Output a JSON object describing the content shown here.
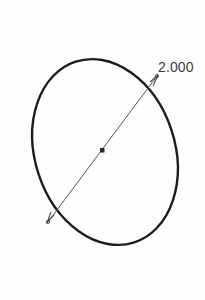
{
  "app": {
    "view_name": "sketch-canvas",
    "background_color": "#fefefe"
  },
  "drawing": {
    "title": "Ellipse with major axis dimension",
    "units_implied": "inches",
    "entities": [
      {
        "name": "ellipse-outline",
        "type": "ellipse",
        "center": {
          "x": 105,
          "y": 152
        },
        "radius_x": 70,
        "radius_y": 95,
        "rotation_deg": -18,
        "stroke_color": "#1d1d1d",
        "stroke_width": 2.4
      },
      {
        "name": "major-axis-dimension-line",
        "type": "line",
        "from": {
          "x": 48,
          "y": 222
        },
        "to": {
          "x": 157,
          "y": 76
        },
        "stroke_color": "#555555",
        "stroke_width": 1
      },
      {
        "name": "center-point-marker",
        "type": "square-point",
        "at": {
          "x": 102,
          "y": 150
        },
        "size": 4,
        "fill_color": "#2a2a2a"
      },
      {
        "name": "endpoint-marker-upper",
        "type": "arrow-tick",
        "at": {
          "x": 157,
          "y": 76
        },
        "stroke_color": "#4a4a4a"
      },
      {
        "name": "endpoint-marker-lower",
        "type": "arrow-tick",
        "at": {
          "x": 48,
          "y": 222
        },
        "stroke_color": "#4a4a4a"
      }
    ]
  },
  "dimension": {
    "value_label": "2.000",
    "label_color": "#3b3b3b",
    "label_position": {
      "x": 158,
      "y": 60
    }
  }
}
